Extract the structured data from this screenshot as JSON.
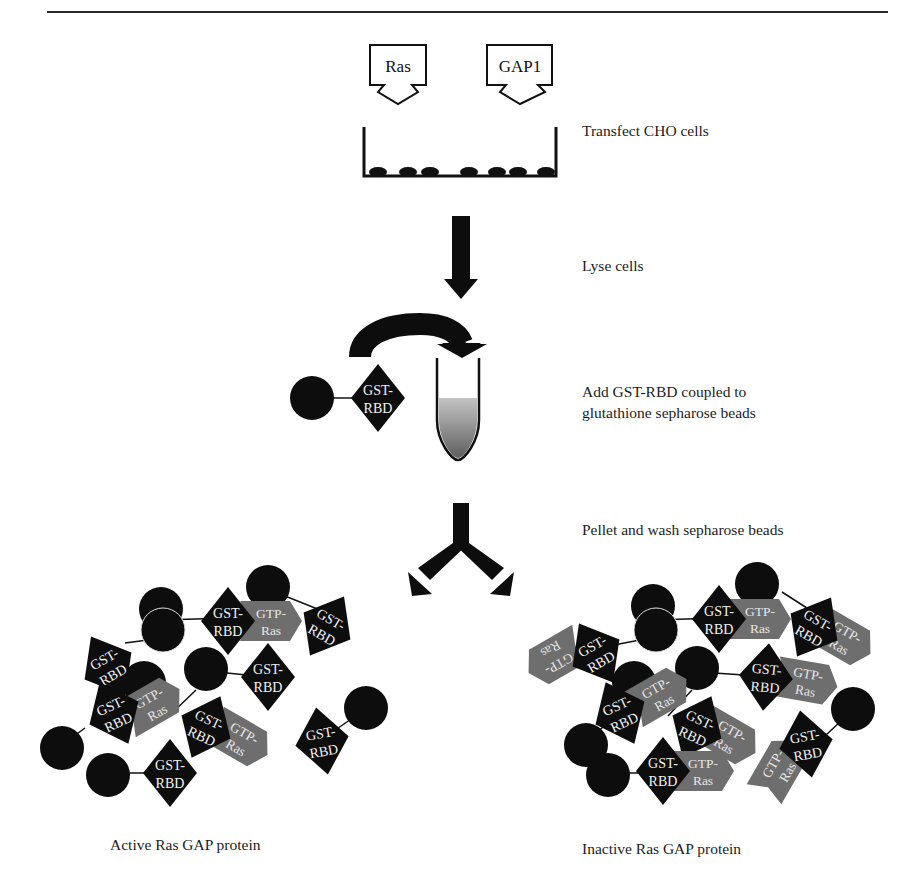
{
  "figure": {
    "plasmids": [
      {
        "label": "Ras"
      },
      {
        "label": "GAP1"
      }
    ],
    "steps": [
      {
        "id": "transfect",
        "text": "Transfect CHO cells"
      },
      {
        "id": "lyse",
        "text": "Lyse cells"
      },
      {
        "id": "add_line1",
        "text": "Add GST-RBD coupled to"
      },
      {
        "id": "add_line2",
        "text": "glutathione sepharose beads"
      },
      {
        "id": "pellet",
        "text": "Pellet and wash sepharose beads"
      }
    ],
    "bait": {
      "top": "GST-",
      "bottom": "RBD"
    },
    "ras": {
      "top": "GTP-",
      "bottom": "Ras"
    },
    "results": [
      {
        "id": "active",
        "caption": "Active Ras GAP protein"
      },
      {
        "id": "inactive",
        "caption": "Inactive Ras GAP protein"
      }
    ],
    "colors": {
      "ink": "#0d0d0d",
      "ras_gray": "#6e6e6e",
      "tube_fill_top": "#bdbdbd",
      "tube_fill_bottom": "#6a6a6a"
    }
  }
}
